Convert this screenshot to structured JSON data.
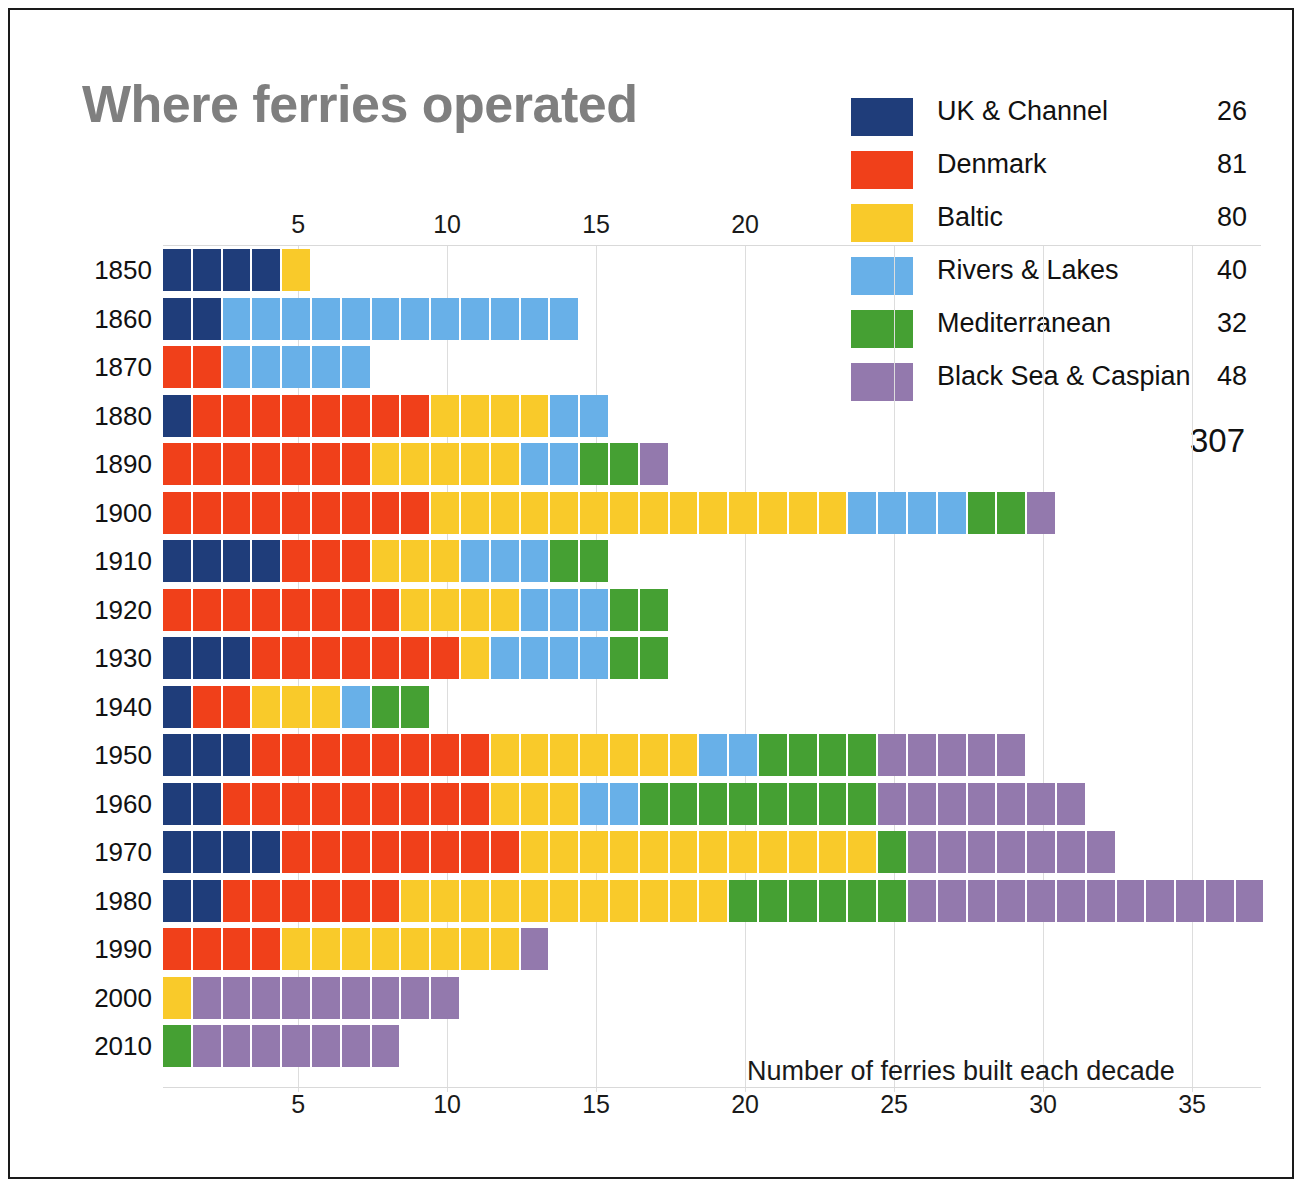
{
  "title": "Where ferries operated",
  "caption": "Number of ferries built each decade",
  "legend": {
    "total": "307",
    "items": [
      {
        "label": "UK & Channel",
        "count": "26",
        "color": "#1f3d7a",
        "key": "uk"
      },
      {
        "label": "Denmark",
        "count": "81",
        "color": "#f0401a",
        "key": "denmark"
      },
      {
        "label": "Baltic",
        "count": "80",
        "color": "#f9ca2a",
        "key": "baltic"
      },
      {
        "label": "Rivers & Lakes",
        "count": "40",
        "color": "#68b0e8",
        "key": "rivers"
      },
      {
        "label": "Mediterranean",
        "count": "32",
        "color": "#45a033",
        "key": "mediterranean"
      },
      {
        "label": "Black Sea & Caspian",
        "count": "48",
        "color": "#9379ad",
        "key": "blacksea"
      }
    ]
  },
  "axis": {
    "top_ticks": [
      "5",
      "10",
      "15",
      "20"
    ],
    "bottom_ticks": [
      "5",
      "10",
      "15",
      "20",
      "25",
      "30",
      "35"
    ]
  },
  "chart_data": {
    "type": "bar",
    "title": "Where ferries operated",
    "xlabel": "Number of ferries built each decade",
    "ylabel": "",
    "orientation": "horizontal",
    "stacked": true,
    "unit": "waffle-squares (1 square = 1 ferry)",
    "xlim": [
      0,
      37
    ],
    "grid": true,
    "legend_position": "top-right",
    "categories": [
      "1850",
      "1860",
      "1870",
      "1880",
      "1890",
      "1900",
      "1910",
      "1920",
      "1930",
      "1940",
      "1950",
      "1960",
      "1970",
      "1980",
      "1990",
      "2000",
      "2010"
    ],
    "series": [
      {
        "name": "UK & Channel",
        "color": "#1f3d7a",
        "total": 26,
        "values": [
          4,
          2,
          0,
          1,
          0,
          0,
          4,
          0,
          3,
          1,
          3,
          2,
          4,
          2,
          0,
          0,
          0
        ]
      },
      {
        "name": "Denmark",
        "color": "#f0401a",
        "total": 81,
        "values": [
          0,
          0,
          2,
          8,
          7,
          9,
          3,
          8,
          7,
          2,
          8,
          9,
          8,
          6,
          4,
          0,
          0
        ]
      },
      {
        "name": "Baltic",
        "color": "#f9ca2a",
        "total": 80,
        "values": [
          1,
          0,
          0,
          4,
          5,
          14,
          3,
          4,
          1,
          3,
          7,
          3,
          12,
          11,
          8,
          1,
          0
        ]
      },
      {
        "name": "Rivers & Lakes",
        "color": "#68b0e8",
        "total": 40,
        "values": [
          0,
          12,
          5,
          2,
          2,
          4,
          3,
          3,
          4,
          1,
          2,
          2,
          0,
          0,
          0,
          0,
          0
        ]
      },
      {
        "name": "Mediterranean",
        "color": "#45a033",
        "total": 32,
        "values": [
          0,
          0,
          0,
          0,
          2,
          2,
          2,
          2,
          2,
          2,
          4,
          8,
          1,
          6,
          0,
          0,
          1
        ]
      },
      {
        "name": "Black Sea & Caspian",
        "color": "#9379ad",
        "total": 48,
        "values": [
          0,
          0,
          0,
          0,
          1,
          1,
          0,
          0,
          0,
          0,
          5,
          7,
          7,
          12,
          1,
          9,
          7
        ]
      }
    ],
    "row_totals": [
      5,
      14,
      7,
      15,
      17,
      30,
      15,
      17,
      17,
      9,
      29,
      31,
      32,
      37,
      13,
      10,
      8
    ],
    "grand_total": 307
  }
}
